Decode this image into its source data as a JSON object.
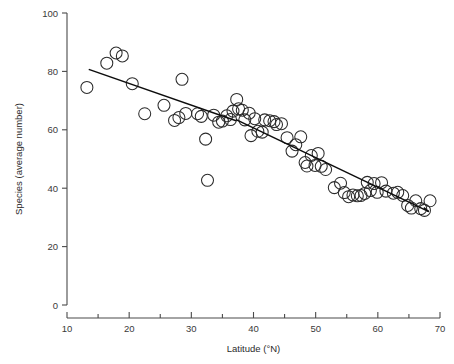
{
  "chart_data": {
    "type": "scatter",
    "title": "",
    "xlabel": "Latitude (°N)",
    "ylabel": "Species (average number)",
    "xlim": [
      10,
      70
    ],
    "ylim": [
      0,
      100
    ],
    "xticks": [
      10,
      20,
      30,
      40,
      50,
      60,
      70
    ],
    "xtick_labels": [
      "10",
      "20",
      "30",
      "40",
      "50",
      "60",
      "70"
    ],
    "xminor_ticks": [
      15,
      25,
      35,
      45,
      55,
      65
    ],
    "yticks": [
      0,
      20,
      40,
      60,
      80,
      100
    ],
    "ytick_labels": [
      "0",
      "20",
      "40",
      "60",
      "80",
      "100"
    ],
    "grid": false,
    "legend": null,
    "marker": "open-circle",
    "marker_size": 6,
    "points": [
      {
        "x": 13.2,
        "y": 74.5
      },
      {
        "x": 16.4,
        "y": 82.8
      },
      {
        "x": 17.9,
        "y": 86.3
      },
      {
        "x": 18.9,
        "y": 85.3
      },
      {
        "x": 20.5,
        "y": 75.8
      },
      {
        "x": 22.5,
        "y": 65.5
      },
      {
        "x": 25.6,
        "y": 68.4
      },
      {
        "x": 27.3,
        "y": 63.2
      },
      {
        "x": 28.0,
        "y": 64.2
      },
      {
        "x": 28.5,
        "y": 77.3
      },
      {
        "x": 29.1,
        "y": 65.6
      },
      {
        "x": 31.0,
        "y": 65.5
      },
      {
        "x": 31.6,
        "y": 64.6
      },
      {
        "x": 32.3,
        "y": 56.8
      },
      {
        "x": 32.6,
        "y": 42.7
      },
      {
        "x": 33.6,
        "y": 65.0
      },
      {
        "x": 34.4,
        "y": 62.6
      },
      {
        "x": 35.0,
        "y": 63.0
      },
      {
        "x": 35.7,
        "y": 64.8
      },
      {
        "x": 36.3,
        "y": 63.5
      },
      {
        "x": 36.7,
        "y": 66.4
      },
      {
        "x": 37.3,
        "y": 70.4
      },
      {
        "x": 37.6,
        "y": 67.2
      },
      {
        "x": 38.2,
        "y": 66.7
      },
      {
        "x": 38.6,
        "y": 63.4
      },
      {
        "x": 39.3,
        "y": 65.7
      },
      {
        "x": 39.6,
        "y": 58.0
      },
      {
        "x": 40.2,
        "y": 63.8
      },
      {
        "x": 40.7,
        "y": 59.5
      },
      {
        "x": 41.4,
        "y": 59.2
      },
      {
        "x": 41.8,
        "y": 63.4
      },
      {
        "x": 42.6,
        "y": 63.1
      },
      {
        "x": 43.3,
        "y": 62.8
      },
      {
        "x": 43.7,
        "y": 61.8
      },
      {
        "x": 44.5,
        "y": 62.1
      },
      {
        "x": 45.4,
        "y": 57.3
      },
      {
        "x": 46.2,
        "y": 52.7
      },
      {
        "x": 46.8,
        "y": 54.9
      },
      {
        "x": 47.6,
        "y": 57.6
      },
      {
        "x": 48.3,
        "y": 48.8
      },
      {
        "x": 48.6,
        "y": 47.6
      },
      {
        "x": 49.3,
        "y": 51.2
      },
      {
        "x": 49.9,
        "y": 47.8
      },
      {
        "x": 50.4,
        "y": 51.9
      },
      {
        "x": 50.9,
        "y": 47.5
      },
      {
        "x": 51.6,
        "y": 46.4
      },
      {
        "x": 53.0,
        "y": 40.2
      },
      {
        "x": 54.0,
        "y": 41.7
      },
      {
        "x": 54.6,
        "y": 38.5
      },
      {
        "x": 55.3,
        "y": 37.1
      },
      {
        "x": 56.0,
        "y": 37.7
      },
      {
        "x": 56.7,
        "y": 37.4
      },
      {
        "x": 57.3,
        "y": 37.5
      },
      {
        "x": 57.9,
        "y": 38.2
      },
      {
        "x": 58.3,
        "y": 42.0
      },
      {
        "x": 58.8,
        "y": 39.2
      },
      {
        "x": 59.4,
        "y": 41.6
      },
      {
        "x": 59.9,
        "y": 38.6
      },
      {
        "x": 60.6,
        "y": 41.9
      },
      {
        "x": 61.3,
        "y": 39.0
      },
      {
        "x": 62.5,
        "y": 38.3
      },
      {
        "x": 63.2,
        "y": 38.6
      },
      {
        "x": 64.0,
        "y": 37.5
      },
      {
        "x": 64.8,
        "y": 34.1
      },
      {
        "x": 65.4,
        "y": 33.2
      },
      {
        "x": 66.1,
        "y": 35.7
      },
      {
        "x": 66.9,
        "y": 33.0
      },
      {
        "x": 67.5,
        "y": 32.4
      },
      {
        "x": 68.4,
        "y": 35.7
      }
    ],
    "fit_lines": [
      {
        "name": "segment-1",
        "x0": 13.5,
        "y0": 80.7,
        "x1": 37.2,
        "y1": 63.1
      },
      {
        "name": "segment-2",
        "x0": 37.2,
        "y0": 63.5,
        "x1": 68.2,
        "y1": 32.0
      }
    ]
  }
}
